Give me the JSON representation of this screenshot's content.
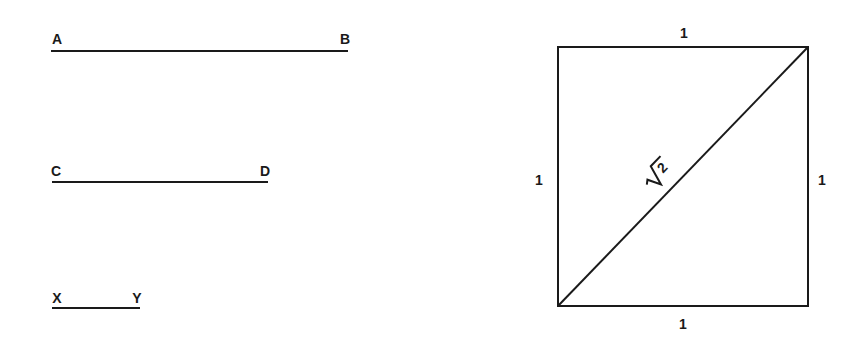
{
  "diagram": {
    "segments": [
      {
        "id": "AB",
        "start_label": "A",
        "end_label": "B",
        "x1": 51,
        "y1": 51,
        "x2": 348,
        "y2": 51,
        "start_label_pos": [
          57,
          44
        ],
        "end_label_pos": [
          345,
          44
        ]
      },
      {
        "id": "CD",
        "start_label": "C",
        "end_label": "D",
        "x1": 52,
        "y1": 182,
        "x2": 268,
        "y2": 182,
        "start_label_pos": [
          56,
          176
        ],
        "end_label_pos": [
          265,
          176
        ]
      },
      {
        "id": "XY",
        "start_label": "X",
        "end_label": "Y",
        "x1": 52,
        "y1": 308,
        "x2": 140,
        "y2": 308,
        "start_label_pos": [
          57,
          303
        ],
        "end_label_pos": [
          137,
          303
        ]
      }
    ],
    "square": {
      "x": 558,
      "y": 47,
      "width": 250,
      "height": 259,
      "side_labels": {
        "top": "1",
        "bottom": "1",
        "left": "1",
        "right": "1"
      },
      "side_label_positions": {
        "top": [
          684,
          38
        ],
        "bottom": [
          683,
          329
        ],
        "left": [
          539,
          185
        ],
        "right": [
          822,
          185
        ]
      },
      "diagonal": {
        "x1": 558,
        "y1": 306,
        "x2": 808,
        "y2": 47,
        "label_radical": "√",
        "label_value": "2",
        "label_center": [
          658,
          176
        ],
        "label_rotation": -46
      }
    }
  }
}
